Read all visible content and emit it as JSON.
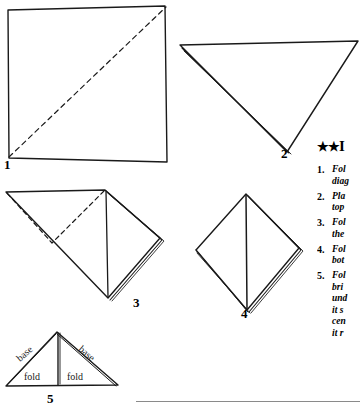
{
  "document": {
    "type": "napkin-folding-illustration",
    "background_color": "#ffffff",
    "ink_color": "#1a1a1a"
  },
  "instructions": {
    "heading": "★★ I",
    "heading_stars": "★★",
    "heading_text": "I",
    "items": [
      {
        "number": "1.",
        "lines": [
          "Fol",
          "diag"
        ]
      },
      {
        "number": "2.",
        "lines": [
          "Pla",
          "top"
        ]
      },
      {
        "number": "3.",
        "lines": [
          "Fol",
          "the"
        ]
      },
      {
        "number": "4.",
        "lines": [
          "Fol",
          "bot"
        ]
      },
      {
        "number": "5.",
        "lines": [
          "Fol",
          "bri",
          "und",
          "it s",
          "cen",
          "it r"
        ]
      }
    ]
  },
  "figures": [
    {
      "id": "figure-1",
      "label": "1",
      "shape": "square",
      "fold_line": "dashed-diagonal-bottom-left-to-top-right",
      "label_position": {
        "x": 4,
        "y": 158
      }
    },
    {
      "id": "figure-2",
      "label": "2",
      "shape": "triangle-pointing-down",
      "fold_line": "none",
      "label_position": {
        "x": 281,
        "y": 147
      }
    },
    {
      "id": "figure-3",
      "label": "3",
      "shape": "diamond-with-center-crease",
      "fold_line": "dashed-upper-left",
      "label_position": {
        "x": 133,
        "y": 296
      }
    },
    {
      "id": "figure-4",
      "label": "4",
      "shape": "diamond-with-center-crease",
      "fold_line": "none",
      "label_position": {
        "x": 241,
        "y": 307
      }
    },
    {
      "id": "figure-5",
      "label": "5",
      "shape": "triangle-pointing-up",
      "fold_line": "vertical-center",
      "label_position": {
        "x": 47,
        "y": 392
      },
      "annotations": [
        {
          "text": "base",
          "side": "left",
          "rotation": -40
        },
        {
          "text": "base",
          "side": "right",
          "rotation": 40
        },
        {
          "text": "fold",
          "side": "left",
          "rotation": 0
        },
        {
          "text": "fold",
          "side": "right",
          "rotation": 0
        }
      ]
    }
  ]
}
